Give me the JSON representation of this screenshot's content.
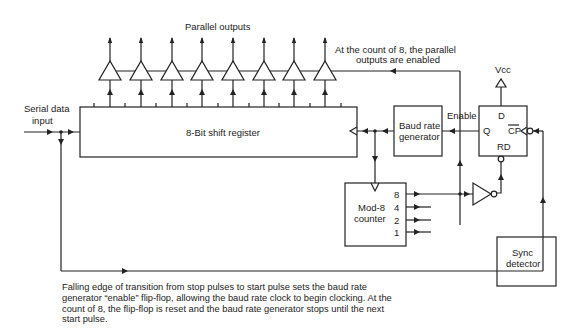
{
  "labels": {
    "parallel_outputs": "Parallel outputs",
    "serial_input_line1": "Serial data",
    "serial_input_line2": "input",
    "shift_register": "8-Bit shift register",
    "count_note_line1": "At the count of 8, the parallel",
    "count_note_line2": "outputs are enabled",
    "baud_line1": "Baud rate",
    "baud_line2": "generator",
    "enable": "Enable",
    "vcc": "Vcc",
    "ff_d": "D",
    "ff_q": "Q",
    "ff_cp": "CP",
    "ff_rd": "RD",
    "counter_line1": "Mod-8",
    "counter_line2": "counter",
    "counter_outputs": [
      "8",
      "4",
      "2",
      "1"
    ],
    "sync_line1": "Sync",
    "sync_line2": "detector"
  },
  "caption": "Falling edge of transition from stop pulses to start pulse sets the baud rate generator “enable” flip-flop, allowing the baud rate clock to begin clocking.  At the count of 8, the flip-flop is reset and the baud rate generator stops until the next start pulse.",
  "buffers": {
    "count": 8
  }
}
